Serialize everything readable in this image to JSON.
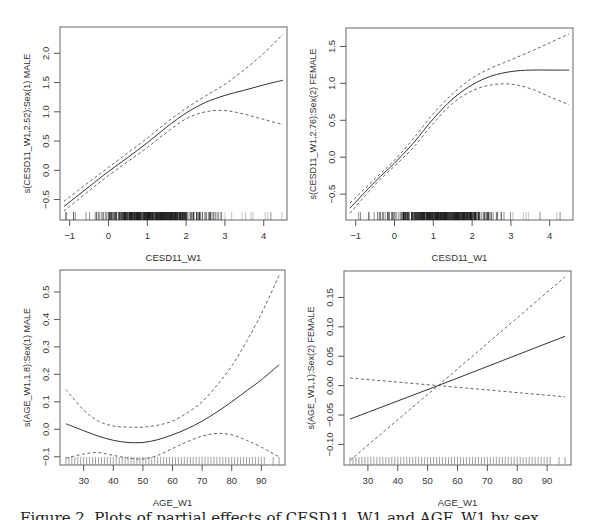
{
  "figure": {
    "caption_partial": "Figure 2. Plots of partial effects of CESD11_W1 and AGE_W1 by sex"
  },
  "chart_data": [
    {
      "type": "line",
      "panel": "top-left",
      "title": "",
      "xlabel": "CESD11_W1",
      "ylabel": "s(CESD11_W1,2.52):Sex(1) MALE",
      "xlim": [
        -1.25,
        4.6
      ],
      "ylim": [
        -0.85,
        2.45
      ],
      "xticks": [
        -1,
        0,
        1,
        2,
        3,
        4
      ],
      "yticks": [
        -0.5,
        0.0,
        0.5,
        1.0,
        1.5,
        2.0
      ],
      "ytick_labels": [
        "-0.5",
        "0.0",
        "0.5",
        "1.0",
        "1.5",
        "2.0"
      ],
      "grid": false,
      "rug": "dense",
      "rug_range": [
        -1.2,
        4.5
      ],
      "x": [
        -1.15,
        -0.5,
        0,
        0.5,
        1,
        1.5,
        2,
        2.5,
        3,
        3.5,
        4,
        4.5
      ],
      "series": [
        {
          "name": "fit",
          "style": "solid",
          "values": [
            -0.62,
            -0.28,
            -0.02,
            0.22,
            0.47,
            0.74,
            0.98,
            1.16,
            1.28,
            1.37,
            1.46,
            1.54
          ]
        },
        {
          "name": "upper_ci",
          "style": "dashed",
          "values": [
            -0.53,
            -0.2,
            0.05,
            0.3,
            0.55,
            0.82,
            1.06,
            1.27,
            1.47,
            1.72,
            2.0,
            2.33
          ]
        },
        {
          "name": "lower_ci",
          "style": "dashed",
          "values": [
            -0.7,
            -0.35,
            -0.09,
            0.15,
            0.39,
            0.65,
            0.88,
            1.0,
            1.02,
            0.96,
            0.87,
            0.78
          ]
        }
      ]
    },
    {
      "type": "line",
      "panel": "top-right",
      "title": "",
      "xlabel": "CESD11_W1",
      "ylabel": "s(CESD11_W1,2.76):Sex(2) FEMALE",
      "xlim": [
        -1.25,
        4.6
      ],
      "ylim": [
        -0.85,
        1.75
      ],
      "xticks": [
        -1,
        0,
        1,
        2,
        3,
        4
      ],
      "yticks": [
        -0.5,
        0.0,
        0.5,
        1.0,
        1.5
      ],
      "ytick_labels": [
        "-0.5",
        "0.0",
        "0.5",
        "1.0",
        "1.5"
      ],
      "grid": false,
      "rug": "dense",
      "rug_range": [
        -1.2,
        4.5
      ],
      "x": [
        -1.15,
        -0.5,
        0,
        0.5,
        1,
        1.5,
        2,
        2.5,
        3,
        3.5,
        4,
        4.5
      ],
      "series": [
        {
          "name": "fit",
          "style": "solid",
          "values": [
            -0.69,
            -0.33,
            -0.08,
            0.2,
            0.52,
            0.79,
            0.98,
            1.1,
            1.16,
            1.18,
            1.18,
            1.18
          ]
        },
        {
          "name": "upper_ci",
          "style": "dashed",
          "values": [
            -0.62,
            -0.29,
            -0.04,
            0.26,
            0.59,
            0.86,
            1.07,
            1.21,
            1.32,
            1.43,
            1.55,
            1.67
          ]
        },
        {
          "name": "lower_ci",
          "style": "dashed",
          "values": [
            -0.76,
            -0.37,
            -0.12,
            0.14,
            0.46,
            0.73,
            0.9,
            0.98,
            0.99,
            0.93,
            0.82,
            0.71
          ]
        }
      ]
    },
    {
      "type": "line",
      "panel": "bottom-left",
      "title": "",
      "xlabel": "AGE_W1",
      "ylabel": "s(AGE_W1,1.8):Sex(1) MALE",
      "xlim": [
        22,
        98
      ],
      "ylim": [
        -0.13,
        0.58
      ],
      "xticks": [
        30,
        40,
        50,
        60,
        70,
        80,
        90
      ],
      "yticks": [
        -0.1,
        0.0,
        0.1,
        0.2,
        0.3,
        0.4,
        0.5
      ],
      "ytick_labels": [
        "-0.1",
        "0.0",
        "0.1",
        "0.2",
        "0.3",
        "0.4",
        "0.5"
      ],
      "grid": false,
      "rug": "regular",
      "rug_range": [
        24,
        96
      ],
      "x": [
        24,
        30,
        35,
        40,
        45,
        50,
        55,
        60,
        65,
        70,
        75,
        80,
        85,
        90,
        96
      ],
      "series": [
        {
          "name": "fit",
          "style": "solid",
          "values": [
            0.02,
            -0.005,
            -0.025,
            -0.04,
            -0.048,
            -0.048,
            -0.038,
            -0.02,
            0.002,
            0.03,
            0.063,
            0.1,
            0.14,
            0.18,
            0.235
          ]
        },
        {
          "name": "upper_ci",
          "style": "dashed",
          "values": [
            0.145,
            0.07,
            0.03,
            0.012,
            0.008,
            0.008,
            0.015,
            0.03,
            0.06,
            0.1,
            0.16,
            0.23,
            0.32,
            0.42,
            0.56
          ]
        },
        {
          "name": "lower_ci",
          "style": "dashed",
          "values": [
            -0.105,
            -0.09,
            -0.085,
            -0.095,
            -0.105,
            -0.108,
            -0.095,
            -0.07,
            -0.045,
            -0.025,
            -0.015,
            -0.02,
            -0.04,
            -0.065,
            -0.1
          ]
        }
      ]
    },
    {
      "type": "line",
      "panel": "bottom-right",
      "title": "",
      "xlabel": "AGE_W1",
      "ylabel": "s(AGE_W1,1):Sex(2) FEMALE",
      "xlim": [
        22,
        98
      ],
      "ylim": [
        -0.135,
        0.195
      ],
      "xticks": [
        30,
        40,
        50,
        60,
        70,
        80,
        90
      ],
      "yticks": [
        -0.1,
        -0.05,
        0.0,
        0.05,
        0.1,
        0.15
      ],
      "ytick_labels": [
        "-0.10",
        "-0.05",
        "0.00",
        "0.05",
        "0.10",
        "0.15"
      ],
      "grid": false,
      "rug": "regular",
      "rug_range": [
        24,
        96
      ],
      "x": [
        24,
        53.5,
        96
      ],
      "series": [
        {
          "name": "fit",
          "style": "solid",
          "values": [
            -0.057,
            0.0,
            0.084
          ]
        },
        {
          "name": "upper_ci",
          "style": "dashed",
          "values": [
            -0.127,
            0.0,
            0.185
          ]
        },
        {
          "name": "lower_ci",
          "style": "dashed",
          "values": [
            0.013,
            0.0,
            -0.019
          ]
        }
      ]
    }
  ],
  "panels_layout": [
    {
      "box": [
        60,
        27,
        287,
        220
      ]
    },
    {
      "box": [
        346,
        28,
        573,
        220
      ]
    },
    {
      "box": [
        60,
        270,
        285,
        465
      ]
    },
    {
      "box": [
        344,
        271,
        571,
        465
      ]
    }
  ]
}
